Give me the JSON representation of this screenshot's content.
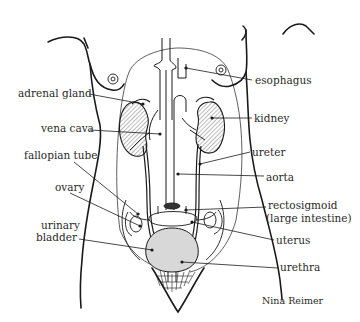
{
  "diagram": {
    "line_color": "#1a1a1a",
    "fill_hatch_color": "#555555",
    "bladder_fill": "#d8d8d8",
    "labels_left": {
      "adrenal_gland": "adrenal gland",
      "vena_cava": "vena cava",
      "fallopian_tube": "fallopian tube",
      "ovary": "ovary",
      "urinary_bladder_line1": "urinary",
      "urinary_bladder_line2": "bladder"
    },
    "labels_right": {
      "esophagus": "esophagus",
      "kidney": "kidney",
      "ureter": "ureter",
      "aorta": "aorta",
      "rectosigmoid_line1": "rectosigmoid",
      "rectosigmoid_line2": "(large intestine)",
      "uterus": "uterus",
      "urethra": "urethra"
    },
    "credit": "Nina Reimer"
  }
}
